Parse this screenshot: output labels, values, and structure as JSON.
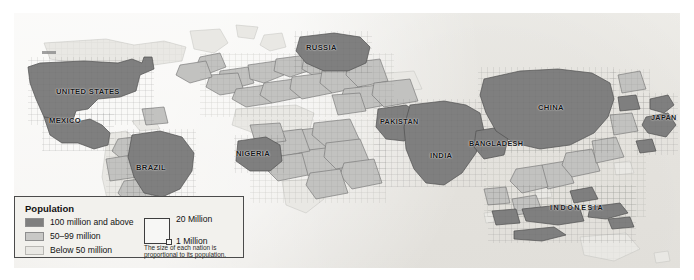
{
  "map": {
    "type": "cartogram",
    "subject": "World population cartogram",
    "note": "The size of each nation is proportional to its population.",
    "background_color": "#efeeea",
    "country_labels": [
      {
        "name": "UNITED STATES",
        "x": 42,
        "y": 78,
        "size": 7.6,
        "tier": "high"
      },
      {
        "name": "MEXICO",
        "x": 35,
        "y": 107,
        "size": 7.6,
        "tier": "high"
      },
      {
        "name": "BRAZIL",
        "x": 134,
        "y": 156,
        "size": 7.6,
        "tier": "high"
      },
      {
        "name": "RUSSIA",
        "x": 305,
        "y": 42,
        "size": 7.6,
        "tier": "high"
      },
      {
        "name": "NIGERIA",
        "x": 244,
        "y": 147,
        "size": 7.6,
        "tier": "high"
      },
      {
        "name": "PAKISTAN",
        "x": 383,
        "y": 115,
        "size": 7.2,
        "tier": "high"
      },
      {
        "name": "INDIA",
        "x": 433,
        "y": 150,
        "size": 7.6,
        "tier": "high"
      },
      {
        "name": "BANGLADESH",
        "x": 470,
        "y": 136,
        "size": 7.2,
        "tier": "high"
      },
      {
        "name": "CHINA",
        "x": 543,
        "y": 103,
        "size": 7.6,
        "tier": "high"
      },
      {
        "name": "JAPAN",
        "x": 654,
        "y": 112,
        "size": 7.2,
        "tier": "high"
      },
      {
        "name": "INDONESIA",
        "x": 562,
        "y": 213,
        "size": 7.2,
        "tier": "high",
        "tracking": 1.6
      }
    ]
  },
  "legend": {
    "title": "Population",
    "items": [
      {
        "label": "100 million and above",
        "color": "#7f7f7f"
      },
      {
        "label": "50–99 million",
        "color": "#c2c2c0"
      },
      {
        "label": "Below 50 million",
        "color": "#e9e8e4"
      }
    ],
    "scale": {
      "big_label": "20 Million",
      "small_label": "1 Million",
      "note": "The size of each nation is proportional to its population."
    }
  },
  "colors": {
    "tier_high": "#7f7f7f",
    "tier_mid": "#c2c2c0",
    "tier_low": "#e9e8e4",
    "outline": "#6a6a6a",
    "paper": "#efeeea",
    "text": "#141414"
  }
}
